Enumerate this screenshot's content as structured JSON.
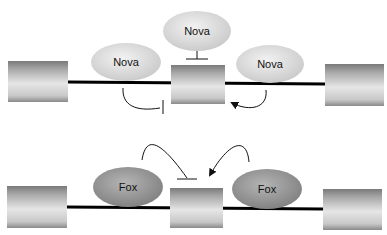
{
  "top_panel": {
    "factor_top_label": "Nova",
    "factor_left_label": "Nova",
    "factor_right_label": "Nova",
    "factor_color": "#dcdcdc"
  },
  "bottom_panel": {
    "factor_left_label": "Fox",
    "factor_right_label": "Fox",
    "factor_color": "#9a9a9a"
  },
  "colors": {
    "intron": "#000000",
    "exon_light": "#e8e8e8",
    "exon_dark": "#8a8a8a"
  }
}
